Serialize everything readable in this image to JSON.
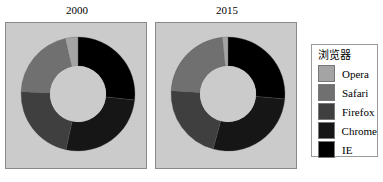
{
  "chart_data": [
    {
      "type": "pie",
      "variant": "donut",
      "title": "2000",
      "start_angle_deg": 0,
      "direction": "clockwise",
      "categories": [
        "IE",
        "Chrome",
        "Firefox",
        "Safari",
        "Opera"
      ],
      "values": [
        26.7,
        26.7,
        22.2,
        20.8,
        3.6
      ],
      "colors": [
        "#000000",
        "#161616",
        "#3f3f3f",
        "#707070",
        "#a4a4a4"
      ]
    },
    {
      "type": "pie",
      "variant": "donut",
      "title": "2015",
      "start_angle_deg": 0,
      "direction": "clockwise",
      "categories": [
        "IE",
        "Chrome",
        "Firefox",
        "Safari",
        "Opera"
      ],
      "values": [
        26.4,
        27.8,
        21.7,
        22.5,
        1.6
      ],
      "colors": [
        "#000000",
        "#161616",
        "#3f3f3f",
        "#707070",
        "#a4a4a4"
      ]
    }
  ],
  "legend": {
    "title": "浏览器",
    "position": "right",
    "items": [
      {
        "label": "Opera",
        "color": "#a4a4a4"
      },
      {
        "label": "Safari",
        "color": "#707070"
      },
      {
        "label": "Firefox",
        "color": "#3f3f3f"
      },
      {
        "label": "Chrome",
        "color": "#161616"
      },
      {
        "label": "IE",
        "color": "#000000"
      }
    ]
  },
  "panels": [
    {
      "title": "2000"
    },
    {
      "title": "2015"
    }
  ]
}
